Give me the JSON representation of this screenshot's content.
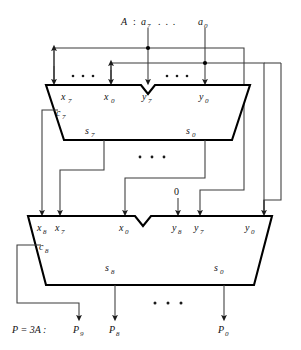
{
  "figure": {
    "type": "logic-block-diagram",
    "background_color": "#ffffff",
    "ink_color": "#000000",
    "wire_color": "#3a3a3a"
  },
  "input_bus": {
    "operand_label": "A",
    "colon": ":",
    "msb": "a",
    "msb_sub": "7",
    "ellipsis": ". . .",
    "lsb": "a",
    "lsb_sub": "0"
  },
  "constant_input": {
    "value": "0"
  },
  "adder_top": {
    "name": "upper-adder",
    "inputs": [
      {
        "label": "x",
        "sub": "7"
      },
      {
        "label": "x",
        "sub": "0"
      },
      {
        "label": "y",
        "sub": "7"
      },
      {
        "label": "y",
        "sub": "0"
      }
    ],
    "carry_out": {
      "label": "c",
      "sub": "7"
    },
    "outputs": [
      {
        "label": "s",
        "sub": "7"
      },
      {
        "label": "s",
        "sub": "0"
      }
    ],
    "input_ellipsis_left": ". . .",
    "input_ellipsis_right": ". . .",
    "output_ellipsis": ". . ."
  },
  "adder_bottom": {
    "name": "lower-adder",
    "inputs": [
      {
        "label": "x",
        "sub": "8"
      },
      {
        "label": "x",
        "sub": "7"
      },
      {
        "label": "x",
        "sub": "0"
      },
      {
        "label": "y",
        "sub": "8"
      },
      {
        "label": "y",
        "sub": "7"
      },
      {
        "label": "y",
        "sub": "0"
      }
    ],
    "carry_out": {
      "label": "c",
      "sub": "8"
    },
    "outputs": [
      {
        "label": "s",
        "sub": "8"
      },
      {
        "label": "s",
        "sub": "0"
      }
    ],
    "output_ellipsis": ". . ."
  },
  "result_bus": {
    "equation": "P = 3A :",
    "bits": [
      {
        "label": "P",
        "sub": "9"
      },
      {
        "label": "P",
        "sub": "8"
      },
      {
        "label": "P",
        "sub": "0"
      }
    ],
    "ellipsis": ". . ."
  }
}
